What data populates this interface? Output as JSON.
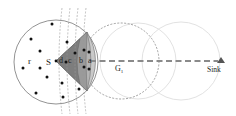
{
  "labels": {
    "source": "S",
    "radius": "r",
    "sub_a": "a",
    "sub_b": "b",
    "sub_c": "c",
    "sub_d": "d",
    "grid": "G",
    "grid_sub": "1",
    "sink": "Sink"
  },
  "colors": {
    "sector_dark": "#7d7d7d",
    "sector_mid": "#9a9a9a",
    "sector_light": "#b4b4b4",
    "sector_lightest": "#c9c9c9",
    "route_line": "#8a8a8a",
    "faint_circle": "#e2e2e2",
    "node": "#111111"
  },
  "nodes": [
    [
      52,
      24
    ],
    [
      31,
      39
    ],
    [
      40,
      51
    ],
    [
      23,
      68
    ],
    [
      40,
      68
    ],
    [
      47,
      77
    ],
    [
      36,
      93
    ],
    [
      67,
      42
    ],
    [
      75,
      53
    ],
    [
      84,
      50
    ],
    [
      89,
      52
    ],
    [
      66,
      62
    ],
    [
      84,
      67
    ],
    [
      89,
      69
    ],
    [
      62,
      83
    ],
    [
      79,
      89
    ],
    [
      63,
      97
    ]
  ]
}
